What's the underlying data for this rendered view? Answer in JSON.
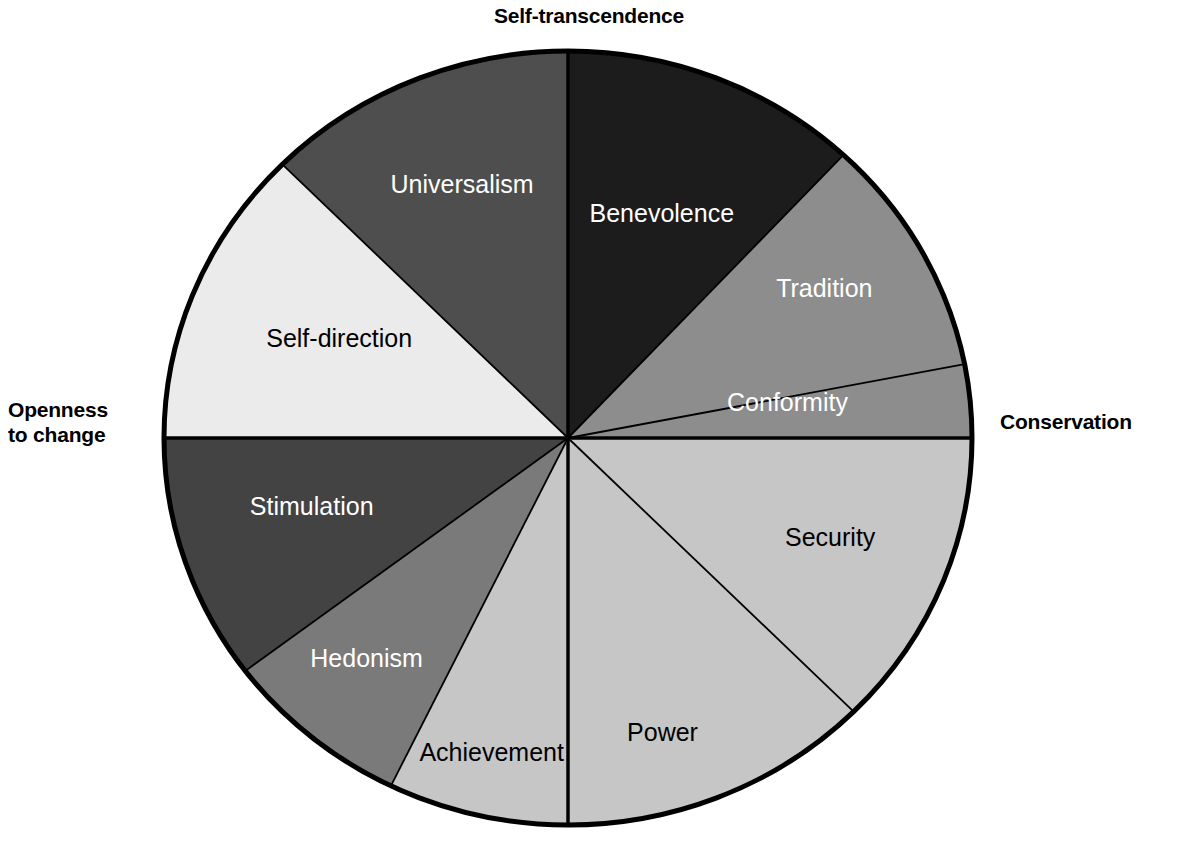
{
  "figure": {
    "type": "circumplex-pie-diagram",
    "title_visible": false,
    "background_color": "#ffffff",
    "outline_color": "#000000",
    "center": {
      "x": 568,
      "y": 438
    },
    "radius_x": 404,
    "radius_y": 387
  },
  "poles": {
    "top": "Self-transcendence",
    "left": "Openness\nto change",
    "right": "Conservation",
    "top_name": "self-transcendence",
    "left_name": "openness-to-change",
    "right_name": "conservation"
  },
  "chart_data": {
    "type": "pie",
    "xlabel": "",
    "ylabel": "",
    "legend_position": "none",
    "grid": false,
    "note": "Angles measured clockwise from 12 o'clock (North). Slice sizes are read off the drawn sector boundaries.",
    "categories": [
      "Benevolence",
      "Tradition",
      "Conformity",
      "Security",
      "Power",
      "Achievement",
      "Hedonism",
      "Stimulation",
      "Self-direction",
      "Universalism"
    ],
    "values": [
      43,
      36,
      11,
      45,
      45,
      26,
      27,
      37,
      45,
      45
    ],
    "slices": [
      {
        "label": "Benevolence",
        "start_deg": 0,
        "end_deg": 43,
        "sweep_deg": 43,
        "fill": "#1c1c1c",
        "text_color": "#ffffff",
        "label_radius_pct": 62,
        "label_angle_deg": 22
      },
      {
        "label": "Tradition",
        "start_deg": 43,
        "end_deg": 79,
        "sweep_deg": 36,
        "fill": "#8d8d8d",
        "text_color": "#ffffff",
        "label_radius_pct": 74,
        "label_angle_deg": 59
      },
      {
        "label": "Conformity",
        "start_deg": 79,
        "end_deg": 90,
        "sweep_deg": 11,
        "fill": "#8d8d8d",
        "text_color": "#ffffff",
        "label_radius_pct": 55,
        "label_angle_deg": 81
      },
      {
        "label": "Security",
        "start_deg": 90,
        "end_deg": 135,
        "sweep_deg": 45,
        "fill": "#c6c6c6",
        "text_color": "#000000",
        "label_radius_pct": 70,
        "label_angle_deg": 112
      },
      {
        "label": "Power",
        "start_deg": 135,
        "end_deg": 180,
        "sweep_deg": 45,
        "fill": "#c6c6c6",
        "text_color": "#000000",
        "label_radius_pct": 80,
        "label_angle_deg": 163
      },
      {
        "label": "Achievement",
        "start_deg": 180,
        "end_deg": 206,
        "sweep_deg": 26,
        "fill": "#c6c6c6",
        "text_color": "#000000",
        "label_radius_pct": 84,
        "label_angle_deg": 193
      },
      {
        "label": "Hedonism",
        "start_deg": 206,
        "end_deg": 233,
        "sweep_deg": 27,
        "fill": "#7a7a7a",
        "text_color": "#ffffff",
        "label_radius_pct": 76,
        "label_angle_deg": 221
      },
      {
        "label": "Stimulation",
        "start_deg": 233,
        "end_deg": 270,
        "sweep_deg": 37,
        "fill": "#434343",
        "text_color": "#ffffff",
        "label_radius_pct": 66,
        "label_angle_deg": 254
      },
      {
        "label": "Self-direction",
        "start_deg": 270,
        "end_deg": 315,
        "sweep_deg": 45,
        "fill": "#ebebeb",
        "text_color": "#000000",
        "label_radius_pct": 62,
        "label_angle_deg": 294
      },
      {
        "label": "Universalism",
        "start_deg": 315,
        "end_deg": 360,
        "sweep_deg": 45,
        "fill": "#4e4e4e",
        "text_color": "#ffffff",
        "label_radius_pct": 70,
        "label_angle_deg": 338
      }
    ],
    "higher_order_groups": [
      {
        "name": "Self-transcendence",
        "members": [
          "Universalism",
          "Benevolence"
        ]
      },
      {
        "name": "Conservation",
        "members": [
          "Tradition",
          "Conformity",
          "Security"
        ]
      },
      {
        "name": "Self-enhancement",
        "members": [
          "Power",
          "Achievement"
        ]
      },
      {
        "name": "Openness to change",
        "members": [
          "Stimulation",
          "Self-direction",
          "Hedonism"
        ]
      }
    ]
  },
  "colors": {
    "outline": "#000000",
    "divider": "#000000",
    "background": "#ffffff"
  }
}
